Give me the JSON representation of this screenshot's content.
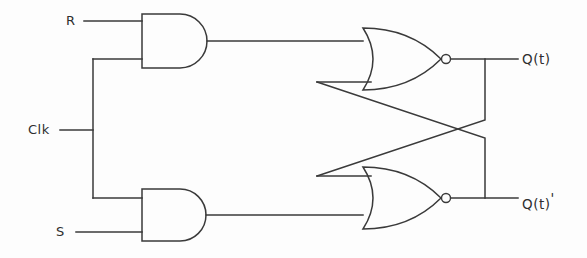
{
  "diagram": {
    "type": "logic-circuit-schematic",
    "line_color": "#3a3a3a",
    "background_color": "#fdfdfd"
  },
  "inputs": [
    {
      "id": "r",
      "label": "R",
      "x": 66,
      "y": 13
    },
    {
      "id": "clk",
      "label": "Clk",
      "x": 28,
      "y": 130
    },
    {
      "id": "s",
      "label": "S",
      "x": 56,
      "y": 215
    }
  ],
  "outputs": [
    {
      "id": "q",
      "label": "Q(t)",
      "prime": "",
      "x": 522,
      "y": 51
    },
    {
      "id": "qn",
      "label": "Q(t)",
      "prime": "'",
      "x": 522,
      "y": 190
    }
  ],
  "gates": [
    {
      "id": "and-top",
      "kind": "AND",
      "inputs": [
        "R",
        "Clk"
      ],
      "output_to": "nor-top"
    },
    {
      "id": "and-bottom",
      "kind": "AND",
      "inputs": [
        "S",
        "Clk"
      ],
      "output_to": "nor-bottom"
    },
    {
      "id": "nor-top",
      "kind": "NOR",
      "inputs": [
        "and-top",
        "feedback-from-qn"
      ],
      "output_to": "Q(t)"
    },
    {
      "id": "nor-bottom",
      "kind": "NOR",
      "inputs": [
        "feedback-from-q",
        "and-bottom"
      ],
      "output_to": "Q(t)'"
    }
  ],
  "feedback": [
    {
      "id": "q-to-nor-bottom",
      "from": "Q(t)",
      "to": "nor-bottom.input-1"
    },
    {
      "id": "qn-to-nor-top",
      "from": "Q(t)'",
      "to": "nor-top.input-2"
    }
  ]
}
